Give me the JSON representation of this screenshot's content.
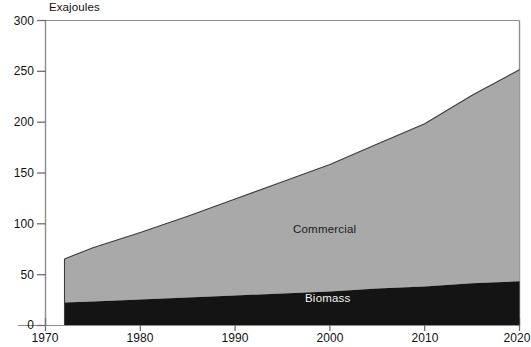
{
  "chart_data": {
    "type": "area",
    "stacked": true,
    "title": "",
    "subtitle": "",
    "unit_label": "Exajoules",
    "xlabel": "",
    "ylabel": "Exajoules",
    "xlim": [
      1970,
      2020
    ],
    "ylim": [
      0,
      300
    ],
    "xticks": [
      1970,
      1980,
      1990,
      2000,
      2010,
      2020
    ],
    "xtick_labels": [
      "1970",
      "1980",
      "1990",
      "2000",
      "2010",
      "2020"
    ],
    "yticks": [
      0,
      50,
      100,
      150,
      200,
      250,
      300
    ],
    "ytick_labels": [
      "0",
      "50",
      "100",
      "150",
      "200",
      "250",
      "300"
    ],
    "grid": false,
    "legend": "in-plot annotations",
    "x": [
      1972,
      1975,
      1980,
      1985,
      1990,
      1995,
      2000,
      2005,
      2010,
      2015,
      2020
    ],
    "series": [
      {
        "name": "Biomass",
        "color": "#141414",
        "label": "Biomass",
        "values": [
          22,
          23,
          25,
          27,
          29,
          31,
          33,
          36,
          38,
          41,
          43
        ]
      },
      {
        "name": "Commercial",
        "color": "#a9a9a9",
        "label": "Commercial",
        "values": [
          43,
          53,
          66,
          80,
          95,
          110,
          125,
          142,
          160,
          185,
          208
        ]
      }
    ],
    "totals": [
      65,
      76,
      91,
      107,
      124,
      141,
      158,
      178,
      198,
      226,
      251
    ],
    "annotations": [
      {
        "text": "Commercial",
        "x": 2000,
        "y": 152,
        "placement": "upper-band"
      },
      {
        "text": "Biomass",
        "x": 2000,
        "y": 20,
        "placement": "lower-band"
      }
    ],
    "colors": {
      "biomass": "#141414",
      "commercial": "#a9a9a9",
      "axis": "#8e8e8e",
      "outline": "#4a4a4a",
      "background": "#ffffff"
    }
  },
  "figure": {
    "unit_caption": "Exajoules",
    "y_labels": [
      "300",
      "250",
      "200",
      "150",
      "100",
      "50",
      "0"
    ],
    "x_labels": [
      "1970",
      "1980",
      "1990",
      "2000",
      "2010",
      "2020"
    ],
    "annotation_commercial": "Commercial",
    "annotation_biomass": "Biomass"
  }
}
